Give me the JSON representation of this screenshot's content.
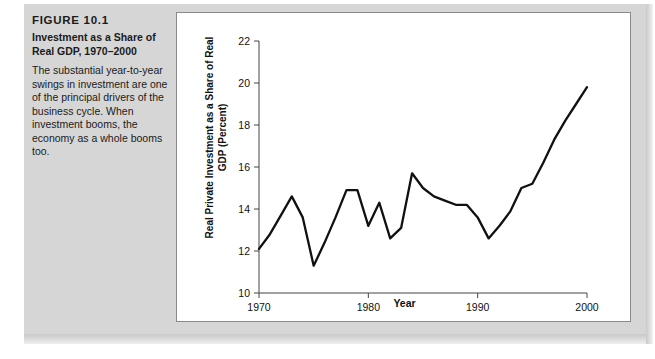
{
  "figure": {
    "number": "FIGURE 10.1",
    "title": "Investment as a Share of Real GDP, 1970–2000",
    "description": "The substantial year-to-year swings in investment are one of the principal drivers of the business cycle. When investment booms, the economy as a whole booms too."
  },
  "colors": {
    "panel_background": "#d6d6d6",
    "chart_background": "#ffffff",
    "line": "#111111",
    "axis": "#444444",
    "text": "#1b1b1b"
  },
  "chart_data": {
    "type": "line",
    "title": "",
    "xlabel": "Year",
    "ylabel": "Real Private Investment as a Share of Real GDP (Percent)",
    "xlim": [
      1970,
      2000
    ],
    "ylim": [
      10,
      22
    ],
    "xticks": [
      1970,
      1980,
      1990,
      2000
    ],
    "yticks": [
      10,
      12,
      14,
      16,
      18,
      20,
      22
    ],
    "xtick_labels": [
      "1970",
      "1980",
      "1990",
      "2000"
    ],
    "ytick_labels": [
      "10",
      "12",
      "14",
      "16",
      "18",
      "20",
      "22"
    ],
    "grid": false,
    "legend": null,
    "x": [
      1970,
      1971,
      1972,
      1973,
      1974,
      1975,
      1976,
      1977,
      1978,
      1979,
      1980,
      1981,
      1982,
      1983,
      1984,
      1985,
      1986,
      1987,
      1988,
      1989,
      1990,
      1991,
      1992,
      1993,
      1994,
      1995,
      1996,
      1997,
      1998,
      1999,
      2000
    ],
    "series": [
      {
        "name": "Real Private Investment as a Share of Real GDP",
        "values": [
          12.1,
          12.8,
          13.7,
          14.6,
          13.6,
          11.3,
          12.4,
          13.6,
          14.9,
          14.9,
          13.2,
          14.3,
          12.6,
          13.1,
          15.7,
          15.0,
          14.6,
          14.4,
          14.2,
          14.2,
          13.6,
          12.6,
          13.2,
          13.9,
          15.0,
          15.2,
          16.2,
          17.3,
          18.2,
          19.0,
          19.8
        ]
      }
    ]
  }
}
